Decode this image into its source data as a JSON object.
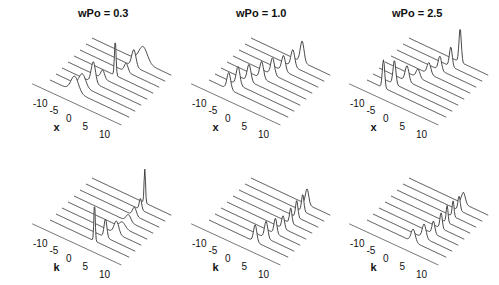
{
  "chart_data": [
    {
      "type": "waterfall-line",
      "title": "wPo = 0.3",
      "xlabel": "x",
      "xticks": [
        "-10",
        "-5",
        "0",
        "5",
        "10"
      ],
      "xlim": [
        -12,
        12
      ],
      "n_traces": 8,
      "peaks": [
        {
          "trace": 0,
          "center": -4.5,
          "height": 0.55,
          "width": 1.6
        },
        {
          "trace": 1,
          "center": -4.0,
          "height": 0.45,
          "width": 1.4
        },
        {
          "trace": 2,
          "center": -2.5,
          "height": 0.75,
          "width": 0.9
        },
        {
          "trace": 3,
          "center": -1.5,
          "height": 0.3,
          "width": 0.8
        },
        {
          "trace": 4,
          "center": 0.5,
          "height": 1.25,
          "width": 0.35
        },
        {
          "trace": 5,
          "center": 2.0,
          "height": 0.3,
          "width": 0.8
        },
        {
          "trace": 6,
          "center": 2.5,
          "height": 0.6,
          "width": 0.9
        },
        {
          "trace": 7,
          "center": 3.5,
          "height": 0.55,
          "width": 1.8
        }
      ]
    },
    {
      "type": "waterfall-line",
      "title": "wPo = 1.0",
      "xlabel": "x",
      "xticks": [
        "-10",
        "-5",
        "0",
        "5",
        "10"
      ],
      "xlim": [
        -12,
        12
      ],
      "n_traces": 8,
      "peaks": [
        {
          "trace": 0,
          "center": -6.0,
          "height": 0.6,
          "width": 0.8
        },
        {
          "trace": 1,
          "center": -5.0,
          "height": 0.65,
          "width": 0.8
        },
        {
          "trace": 2,
          "center": -3.5,
          "height": 0.6,
          "width": 0.8
        },
        {
          "trace": 3,
          "center": -1.5,
          "height": 0.6,
          "width": 0.8
        },
        {
          "trace": 4,
          "center": 0.0,
          "height": 0.6,
          "width": 0.8
        },
        {
          "trace": 5,
          "center": 1.5,
          "height": 0.55,
          "width": 0.8
        },
        {
          "trace": 6,
          "center": 2.5,
          "height": 0.6,
          "width": 0.8
        },
        {
          "trace": 7,
          "center": 3.5,
          "height": 0.75,
          "width": 0.8
        }
      ]
    },
    {
      "type": "waterfall-line",
      "title": "wPo = 2.5",
      "xlabel": "x",
      "xticks": [
        "-10",
        "-5",
        "0",
        "5",
        "10"
      ],
      "xlim": [
        -12,
        12
      ],
      "n_traces": 8,
      "peaks": [
        {
          "trace": 0,
          "center": -7.0,
          "height": 1.0,
          "width": 0.5
        },
        {
          "trace": 1,
          "center": -5.5,
          "height": 0.85,
          "width": 0.6
        },
        {
          "trace": 2,
          "center": -3.5,
          "height": 0.55,
          "width": 0.8
        },
        {
          "trace": 3,
          "center": -2.0,
          "height": 0.3,
          "width": 0.8
        },
        {
          "trace": 4,
          "center": -0.5,
          "height": 0.4,
          "width": 0.8
        },
        {
          "trace": 5,
          "center": 1.0,
          "height": 0.5,
          "width": 0.7
        },
        {
          "trace": 6,
          "center": 2.5,
          "height": 0.7,
          "width": 0.6
        },
        {
          "trace": 7,
          "center": 3.5,
          "height": 1.2,
          "width": 0.5
        }
      ]
    },
    {
      "type": "waterfall-line",
      "title": "",
      "xlabel": "k",
      "xticks": [
        "-10",
        "-5",
        "0",
        "5",
        "10"
      ],
      "xlim": [
        -12,
        12
      ],
      "n_traces": 8,
      "peaks": [
        {
          "trace": 0,
          "center": 1.5,
          "height": 1.35,
          "width": 0.3
        },
        {
          "trace": 1,
          "center": 3.0,
          "height": 0.65,
          "width": 0.6
        },
        {
          "trace": 2,
          "center": 4.5,
          "height": 0.45,
          "width": 1.0
        },
        {
          "trace": 3,
          "center": 4.5,
          "height": 0.2,
          "width": 1.2
        },
        {
          "trace": 4,
          "center": 4.5,
          "height": 0.25,
          "width": 1.0
        },
        {
          "trace": 5,
          "center": 4.5,
          "height": 0.3,
          "width": 0.8
        },
        {
          "trace": 6,
          "center": 4.5,
          "height": 0.4,
          "width": 0.5
        },
        {
          "trace": 7,
          "center": 4.0,
          "height": 1.2,
          "width": 0.3
        }
      ]
    },
    {
      "type": "waterfall-line",
      "title": "",
      "xlabel": "k",
      "xticks": [
        "-10",
        "-5",
        "0",
        "5",
        "10"
      ],
      "xlim": [
        -12,
        12
      ],
      "n_traces": 8,
      "peaks": [
        {
          "trace": 0,
          "center": 2.0,
          "height": 0.6,
          "width": 0.7
        },
        {
          "trace": 1,
          "center": 3.5,
          "height": 0.6,
          "width": 0.7
        },
        {
          "trace": 2,
          "center": 4.5,
          "height": 0.55,
          "width": 0.6
        },
        {
          "trace": 3,
          "center": 5.0,
          "height": 0.45,
          "width": 0.6
        },
        {
          "trace": 4,
          "center": 5.5,
          "height": 0.55,
          "width": 0.5
        },
        {
          "trace": 5,
          "center": 5.5,
          "height": 0.6,
          "width": 0.5
        },
        {
          "trace": 6,
          "center": 5.5,
          "height": 0.6,
          "width": 0.5
        },
        {
          "trace": 7,
          "center": 5.0,
          "height": 0.55,
          "width": 0.7
        }
      ]
    },
    {
      "type": "waterfall-line",
      "title": "",
      "xlabel": "k",
      "xticks": [
        "-10",
        "-5",
        "0",
        "5",
        "10"
      ],
      "xlim": [
        -12,
        12
      ],
      "n_traces": 8,
      "peaks": [
        {
          "trace": 0,
          "center": 2.0,
          "height": 0.45,
          "width": 0.9
        },
        {
          "trace": 1,
          "center": 3.5,
          "height": 0.5,
          "width": 0.8
        },
        {
          "trace": 2,
          "center": 4.5,
          "height": 0.45,
          "width": 0.6
        },
        {
          "trace": 3,
          "center": 5.0,
          "height": 0.55,
          "width": 0.5
        },
        {
          "trace": 4,
          "center": 5.0,
          "height": 0.6,
          "width": 0.4
        },
        {
          "trace": 5,
          "center": 5.0,
          "height": 0.55,
          "width": 0.4
        },
        {
          "trace": 6,
          "center": 5.0,
          "height": 0.5,
          "width": 0.5
        },
        {
          "trace": 7,
          "center": 4.5,
          "height": 0.4,
          "width": 0.8
        }
      ]
    }
  ]
}
